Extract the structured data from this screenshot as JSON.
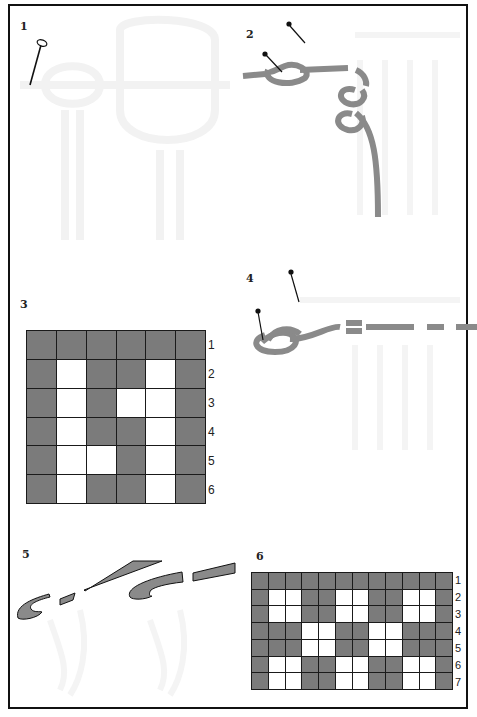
{
  "colors": {
    "frame": "#111111",
    "rope": "#8a8a8a",
    "cell_filled": "#7b7b7b",
    "cell_empty": "#ffffff",
    "ghost": "#f3f3f3"
  },
  "panels": [
    {
      "id": "1",
      "label": "1",
      "content": "pin"
    },
    {
      "id": "2",
      "label": "2",
      "content": "knot tied at pin with looped cord turning downward"
    },
    {
      "id": "3",
      "label": "3",
      "content": "pattern grid 6x6"
    },
    {
      "id": "4",
      "label": "4",
      "content": "knot at pin with segmented cord extending right"
    },
    {
      "id": "5",
      "label": "5",
      "content": "two hooked cord ends with segmented strips"
    },
    {
      "id": "6",
      "label": "6",
      "content": "pattern grid 12x7"
    }
  ],
  "grid3": {
    "columns": 6,
    "row_labels": [
      "1",
      "2",
      "3",
      "4",
      "5",
      "6"
    ],
    "rows": [
      "GGGGGG",
      "GWGGWG",
      "GWGWWG",
      "GWGGWG",
      "GWWGWG",
      "GWGGWG"
    ]
  },
  "grid6": {
    "columns": 12,
    "row_labels": [
      "1",
      "2",
      "3",
      "4",
      "5",
      "6",
      "7"
    ],
    "rows": [
      "GGGGGGGGGGGG",
      "GWWGGWWGGWWG",
      "GWWGGWWGGWWG",
      "GGGWWGGWWGGG",
      "GGGWWGGWWGGG",
      "GWWGGWWGGWWG",
      "GWWGGWWGGWWG"
    ]
  }
}
